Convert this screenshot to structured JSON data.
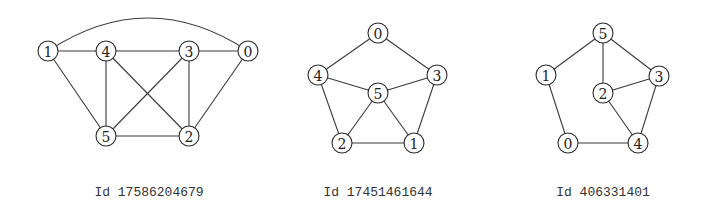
{
  "node_radius": 10,
  "colors": {
    "stroke": "#2a2a2a",
    "edge": "#3a3a3a",
    "text": "#222222",
    "background": "#ffffff"
  },
  "graphs": [
    {
      "caption": "Id 17586204679",
      "caption_pos": [
        149,
        192
      ],
      "nodes": [
        {
          "id": "0",
          "x": 248,
          "y": 51
        },
        {
          "id": "1",
          "x": 48,
          "y": 51
        },
        {
          "id": "2",
          "x": 189,
          "y": 136
        },
        {
          "id": "3",
          "x": 189,
          "y": 51
        },
        {
          "id": "4",
          "x": 106,
          "y": 51
        },
        {
          "id": "5",
          "x": 106,
          "y": 136
        }
      ],
      "edges": [
        [
          "1",
          "4"
        ],
        [
          "4",
          "3"
        ],
        [
          "3",
          "0"
        ],
        [
          "1",
          "5"
        ],
        [
          "4",
          "5"
        ],
        [
          "4",
          "2"
        ],
        [
          "3",
          "5"
        ],
        [
          "3",
          "2"
        ],
        [
          "0",
          "2"
        ],
        [
          "5",
          "2"
        ]
      ],
      "curved_edges": [
        {
          "from": "1",
          "to": "0",
          "ctrl": [
            148,
            -15
          ]
        }
      ]
    },
    {
      "caption": "Id 17451461644",
      "caption_pos": [
        378,
        192
      ],
      "nodes": [
        {
          "id": "0",
          "x": 378,
          "y": 33
        },
        {
          "id": "1",
          "x": 414,
          "y": 143
        },
        {
          "id": "2",
          "x": 342,
          "y": 143
        },
        {
          "id": "3",
          "x": 437,
          "y": 75
        },
        {
          "id": "4",
          "x": 318,
          "y": 75
        },
        {
          "id": "5",
          "x": 378,
          "y": 93
        }
      ],
      "edges": [
        [
          "0",
          "4"
        ],
        [
          "0",
          "3"
        ],
        [
          "4",
          "5"
        ],
        [
          "5",
          "3"
        ],
        [
          "4",
          "2"
        ],
        [
          "3",
          "1"
        ],
        [
          "5",
          "2"
        ],
        [
          "5",
          "1"
        ],
        [
          "2",
          "1"
        ]
      ],
      "curved_edges": []
    },
    {
      "caption": "Id 406331401",
      "caption_pos": [
        603,
        192
      ],
      "nodes": [
        {
          "id": "0",
          "x": 568,
          "y": 143
        },
        {
          "id": "1",
          "x": 546,
          "y": 75
        },
        {
          "id": "2",
          "x": 603,
          "y": 93
        },
        {
          "id": "3",
          "x": 659,
          "y": 76
        },
        {
          "id": "4",
          "x": 638,
          "y": 143
        },
        {
          "id": "5",
          "x": 603,
          "y": 33
        }
      ],
      "edges": [
        [
          "5",
          "1"
        ],
        [
          "5",
          "2"
        ],
        [
          "5",
          "3"
        ],
        [
          "1",
          "0"
        ],
        [
          "2",
          "3"
        ],
        [
          "2",
          "4"
        ],
        [
          "3",
          "4"
        ],
        [
          "0",
          "4"
        ]
      ],
      "curved_edges": []
    }
  ]
}
